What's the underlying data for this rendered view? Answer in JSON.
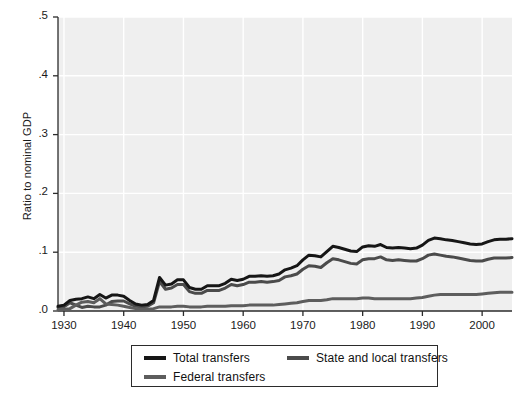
{
  "chart_data": {
    "type": "line",
    "title": "",
    "subtitle": "",
    "xlabel": "",
    "ylabel": "Ratio to nominal GDP",
    "xlim": [
      1929,
      2005
    ],
    "ylim": [
      0.0,
      0.5
    ],
    "xticks": [
      1930,
      1940,
      1950,
      1960,
      1970,
      1980,
      1990,
      2000
    ],
    "xtick_labels": [
      "1930",
      "1940",
      "1950",
      "1960",
      "1970",
      "1980",
      "1990",
      "2000"
    ],
    "yticks": [
      0.0,
      0.1,
      0.2,
      0.3,
      0.4,
      0.5
    ],
    "ytick_labels": [
      ".0",
      ".1",
      ".2",
      ".3",
      ".4",
      ".5"
    ],
    "grid": true,
    "grid_color": "#ffffff",
    "plot_background": "#efefef",
    "legend_position": "below-center",
    "x": [
      1929,
      1930,
      1931,
      1932,
      1933,
      1934,
      1935,
      1936,
      1937,
      1938,
      1939,
      1940,
      1941,
      1942,
      1943,
      1944,
      1945,
      1946,
      1947,
      1948,
      1949,
      1950,
      1951,
      1952,
      1953,
      1954,
      1955,
      1956,
      1957,
      1958,
      1959,
      1960,
      1961,
      1962,
      1963,
      1964,
      1965,
      1966,
      1967,
      1968,
      1969,
      1970,
      1971,
      1972,
      1973,
      1974,
      1975,
      1976,
      1977,
      1978,
      1979,
      1980,
      1981,
      1982,
      1983,
      1984,
      1985,
      1986,
      1987,
      1988,
      1989,
      1990,
      1991,
      1992,
      1993,
      1994,
      1995,
      1996,
      1997,
      1998,
      1999,
      2000,
      2001,
      2002,
      2003,
      2004,
      2005
    ],
    "series": [
      {
        "name": "Total transfers",
        "color": "#161616",
        "width": 3.0,
        "values": [
          0.008,
          0.01,
          0.018,
          0.02,
          0.021,
          0.024,
          0.021,
          0.028,
          0.022,
          0.027,
          0.027,
          0.025,
          0.018,
          0.012,
          0.01,
          0.011,
          0.018,
          0.057,
          0.044,
          0.046,
          0.053,
          0.053,
          0.04,
          0.037,
          0.037,
          0.043,
          0.043,
          0.043,
          0.047,
          0.054,
          0.052,
          0.054,
          0.059,
          0.059,
          0.06,
          0.059,
          0.06,
          0.063,
          0.07,
          0.073,
          0.077,
          0.087,
          0.095,
          0.094,
          0.092,
          0.101,
          0.11,
          0.108,
          0.105,
          0.102,
          0.101,
          0.109,
          0.111,
          0.11,
          0.113,
          0.108,
          0.107,
          0.108,
          0.107,
          0.106,
          0.107,
          0.112,
          0.12,
          0.124,
          0.123,
          0.121,
          0.12,
          0.118,
          0.116,
          0.114,
          0.113,
          0.114,
          0.118,
          0.121,
          0.122,
          0.122,
          0.123
        ]
      },
      {
        "name": "Federal transfers",
        "color": "#5d5d5d",
        "width": 3.0,
        "values": [
          0.002,
          0.003,
          0.004,
          0.01,
          0.015,
          0.016,
          0.014,
          0.021,
          0.012,
          0.011,
          0.01,
          0.008,
          0.006,
          0.004,
          0.003,
          0.003,
          0.004,
          0.007,
          0.007,
          0.007,
          0.008,
          0.008,
          0.007,
          0.007,
          0.007,
          0.008,
          0.008,
          0.008,
          0.008,
          0.009,
          0.009,
          0.009,
          0.01,
          0.01,
          0.01,
          0.01,
          0.01,
          0.011,
          0.012,
          0.013,
          0.014,
          0.016,
          0.018,
          0.018,
          0.018,
          0.019,
          0.021,
          0.021,
          0.021,
          0.021,
          0.021,
          0.022,
          0.022,
          0.021,
          0.021,
          0.021,
          0.021,
          0.021,
          0.021,
          0.021,
          0.022,
          0.023,
          0.025,
          0.027,
          0.028,
          0.028,
          0.028,
          0.028,
          0.028,
          0.028,
          0.028,
          0.029,
          0.03,
          0.031,
          0.032,
          0.032,
          0.032
        ]
      },
      {
        "name": "State and local transfers",
        "color": "#4b4b4b",
        "width": 3.0,
        "values": [
          0.006,
          0.007,
          0.014,
          0.01,
          0.006,
          0.008,
          0.007,
          0.007,
          0.01,
          0.016,
          0.017,
          0.017,
          0.012,
          0.008,
          0.007,
          0.008,
          0.014,
          0.05,
          0.037,
          0.039,
          0.045,
          0.045,
          0.033,
          0.03,
          0.03,
          0.035,
          0.035,
          0.035,
          0.039,
          0.045,
          0.043,
          0.045,
          0.049,
          0.049,
          0.05,
          0.049,
          0.05,
          0.052,
          0.058,
          0.06,
          0.063,
          0.071,
          0.077,
          0.076,
          0.074,
          0.082,
          0.089,
          0.087,
          0.084,
          0.081,
          0.08,
          0.087,
          0.089,
          0.089,
          0.092,
          0.087,
          0.086,
          0.087,
          0.086,
          0.085,
          0.085,
          0.089,
          0.095,
          0.097,
          0.095,
          0.093,
          0.092,
          0.09,
          0.088,
          0.086,
          0.085,
          0.085,
          0.088,
          0.09,
          0.09,
          0.09,
          0.091
        ]
      }
    ]
  },
  "legend": {
    "entries": [
      {
        "label": "Total transfers",
        "color": "#161616"
      },
      {
        "label": "State and local transfers",
        "color": "#4b4b4b"
      },
      {
        "label": "Federal transfers",
        "color": "#5d5d5d"
      }
    ]
  }
}
